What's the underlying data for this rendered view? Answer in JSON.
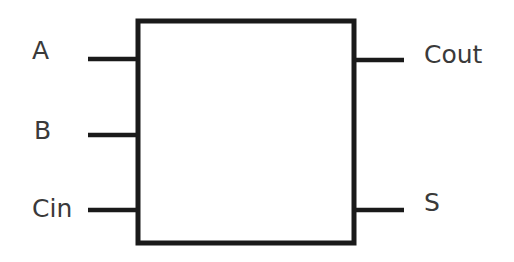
{
  "diagram": {
    "block": {
      "label": ""
    },
    "inputs": [
      {
        "label": "A"
      },
      {
        "label": "B"
      },
      {
        "label": "Cin"
      }
    ],
    "outputs": [
      {
        "label": "Cout"
      },
      {
        "label": "S"
      }
    ],
    "colors": {
      "stroke": "#1a1a1a",
      "text": "#3a3a3a",
      "background": "#ffffff"
    }
  }
}
